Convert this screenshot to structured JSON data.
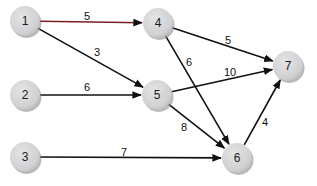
{
  "diagram": {
    "type": "directed-weighted-graph",
    "nodes": [
      {
        "id": "1",
        "label": "1",
        "x": 25,
        "y": 21
      },
      {
        "id": "2",
        "label": "2",
        "x": 25,
        "y": 95
      },
      {
        "id": "3",
        "label": "3",
        "x": 25,
        "y": 157
      },
      {
        "id": "4",
        "label": "4",
        "x": 158,
        "y": 23
      },
      {
        "id": "5",
        "label": "5",
        "x": 157,
        "y": 95
      },
      {
        "id": "6",
        "label": "6",
        "x": 237,
        "y": 158
      },
      {
        "id": "7",
        "label": "7",
        "x": 288,
        "y": 66
      }
    ],
    "edges": [
      {
        "from": "1",
        "to": "4",
        "weight": "5",
        "color": "#7a1f1f",
        "label_x": 87,
        "label_y": 16
      },
      {
        "from": "1",
        "to": "5",
        "weight": "3",
        "color": "#111111",
        "label_x": 97,
        "label_y": 52
      },
      {
        "from": "2",
        "to": "5",
        "weight": "6",
        "color": "#111111",
        "label_x": 87,
        "label_y": 87
      },
      {
        "from": "3",
        "to": "6",
        "weight": "7",
        "color": "#111111",
        "label_x": 124,
        "label_y": 152
      },
      {
        "from": "4",
        "to": "7",
        "weight": "5",
        "color": "#111111",
        "label_x": 228,
        "label_y": 40
      },
      {
        "from": "4",
        "to": "6",
        "weight": "6",
        "color": "#111111",
        "label_x": 189,
        "label_y": 62
      },
      {
        "from": "5",
        "to": "7",
        "weight": "10",
        "color": "#111111",
        "label_x": 230,
        "label_y": 72
      },
      {
        "from": "5",
        "to": "6",
        "weight": "8",
        "color": "#111111",
        "label_x": 184,
        "label_y": 127
      },
      {
        "from": "6",
        "to": "7",
        "weight": "4",
        "color": "#111111",
        "label_x": 265,
        "label_y": 122
      }
    ],
    "style": {
      "node_fill": "#d4d4d6",
      "node_shadow": "#8a8a8a",
      "node_radius": 15,
      "background": "#ffffff"
    }
  }
}
